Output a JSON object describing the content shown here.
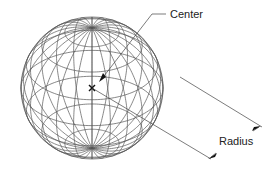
{
  "diagram": {
    "labels": {
      "center": "Center",
      "radius": "Radius"
    },
    "sphere": {
      "cx": 92,
      "cy": 88,
      "r": 71,
      "tilt_deg": 32,
      "meridians": 12,
      "parallels": 8
    },
    "colors": {
      "wire": "#555555",
      "leader": "#444444",
      "text": "#222222",
      "background": "#ffffff"
    }
  }
}
